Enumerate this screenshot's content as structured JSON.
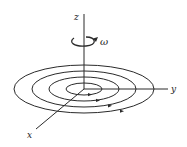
{
  "diagram": {
    "labels": {
      "z_axis": "z",
      "y_axis": "y",
      "x_axis": "x",
      "angular_velocity": "ω"
    },
    "colors": {
      "line": "#2a2a2a",
      "background": "#ffffff"
    },
    "center": {
      "x": 84,
      "y": 89
    },
    "orbits": [
      {
        "rx": 18,
        "ry": 6
      },
      {
        "rx": 35,
        "ry": 12
      },
      {
        "rx": 52,
        "ry": 18
      },
      {
        "rx": 70,
        "ry": 24
      }
    ]
  }
}
